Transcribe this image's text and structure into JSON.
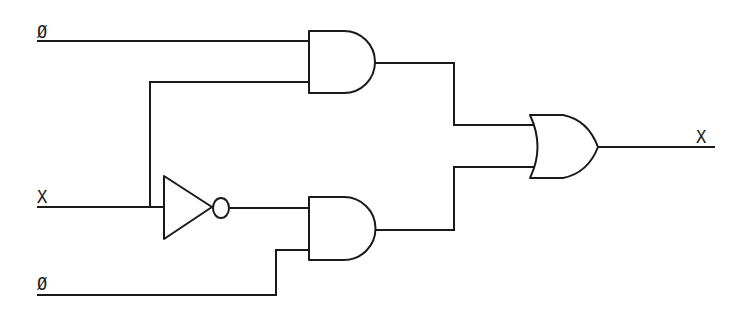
{
  "diagram": {
    "type": "logic-circuit",
    "colors": {
      "line": "#1a1a1a",
      "background": "#ffffff"
    },
    "labels": {
      "input_top": "Ø",
      "input_x": "X",
      "input_bottom": "Ø",
      "output": "X"
    },
    "gates": [
      {
        "id": "and-top",
        "kind": "AND"
      },
      {
        "id": "not",
        "kind": "NOT"
      },
      {
        "id": "and-bottom",
        "kind": "AND"
      },
      {
        "id": "or",
        "kind": "OR"
      }
    ]
  }
}
